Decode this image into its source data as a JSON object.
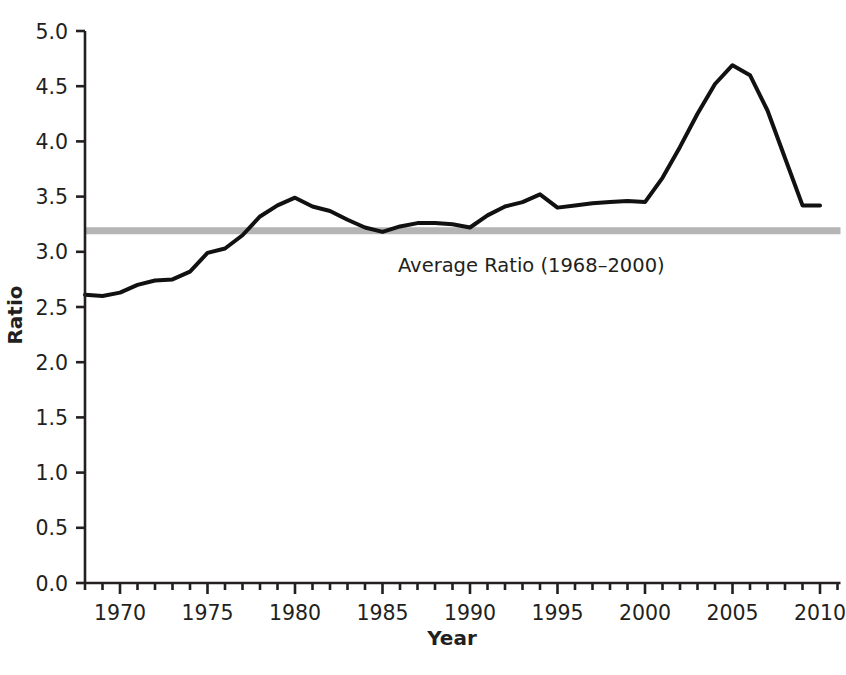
{
  "chart_data": {
    "type": "line",
    "title": "",
    "xlabel": "Year",
    "ylabel": "Ratio",
    "xlim": [
      1968,
      2011
    ],
    "ylim": [
      0.0,
      5.0
    ],
    "grid": false,
    "legend_position": "none",
    "x_major_ticks": [
      1970,
      1975,
      1980,
      1985,
      1990,
      1995,
      2000,
      2005,
      2010
    ],
    "x_tick_labels": [
      "1970",
      "1975",
      "1980",
      "1985",
      "1990",
      "1995",
      "2000",
      "2005",
      "2010"
    ],
    "x_minor_tick_step": 1,
    "y_ticks": [
      0.0,
      0.5,
      1.0,
      1.5,
      2.0,
      2.5,
      3.0,
      3.5,
      4.0,
      4.5,
      5.0
    ],
    "y_tick_labels": [
      "0.0",
      "0.5",
      "1.0",
      "1.5",
      "2.0",
      "2.5",
      "3.0",
      "3.5",
      "4.0",
      "4.5",
      "5.0"
    ],
    "series": [
      {
        "name": "Ratio",
        "color": "#111111",
        "line_width": 4,
        "x": [
          1968,
          1969,
          1970,
          1971,
          1972,
          1973,
          1974,
          1975,
          1976,
          1977,
          1978,
          1979,
          1980,
          1981,
          1982,
          1983,
          1984,
          1985,
          1986,
          1987,
          1988,
          1989,
          1990,
          1991,
          1992,
          1993,
          1994,
          1995,
          1996,
          1997,
          1998,
          1999,
          2000,
          2001,
          2002,
          2003,
          2004,
          2005,
          2006,
          2007,
          2008,
          2009,
          2010
        ],
        "values": [
          2.61,
          2.6,
          2.63,
          2.7,
          2.74,
          2.75,
          2.82,
          2.99,
          3.03,
          3.15,
          3.32,
          3.42,
          3.49,
          3.41,
          3.37,
          3.29,
          3.22,
          3.18,
          3.23,
          3.26,
          3.26,
          3.25,
          3.22,
          3.33,
          3.41,
          3.45,
          3.52,
          3.4,
          3.42,
          3.44,
          3.45,
          3.46,
          3.45,
          3.67,
          3.95,
          4.25,
          4.52,
          4.69,
          4.6,
          4.28,
          3.85,
          3.42,
          3.42
        ]
      }
    ],
    "reference_line": {
      "label": "Average Ratio (1968–2000)",
      "value": 3.19,
      "color": "#b5b5b5",
      "line_width": 7,
      "label_x": 1993.5,
      "label_y": 2.82
    }
  }
}
